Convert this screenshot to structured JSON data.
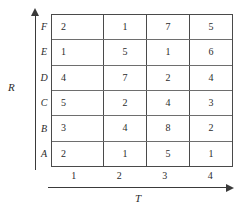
{
  "chart_data": {
    "type": "table",
    "title": "",
    "xlabel": "T",
    "ylabel": "R",
    "grid": true,
    "legend": "none",
    "columns": [
      "1",
      "2",
      "3",
      "4"
    ],
    "rows_top_to_bottom": [
      "F",
      "E",
      "D",
      "C",
      "B",
      "A"
    ],
    "values_top_to_bottom": [
      [
        2,
        1,
        7,
        5
      ],
      [
        1,
        5,
        1,
        6
      ],
      [
        4,
        7,
        2,
        4
      ],
      [
        5,
        2,
        4,
        3
      ],
      [
        3,
        4,
        8,
        2
      ],
      [
        2,
        1,
        5,
        1
      ]
    ],
    "cells": [
      {
        "row": "F",
        "values": [
          "2",
          "1",
          "7",
          "5"
        ]
      },
      {
        "row": "E",
        "values": [
          "1",
          "5",
          "1",
          "6"
        ]
      },
      {
        "row": "D",
        "values": [
          "4",
          "7",
          "2",
          "4"
        ]
      },
      {
        "row": "C",
        "values": [
          "5",
          "2",
          "4",
          "3"
        ]
      },
      {
        "row": "B",
        "values": [
          "3",
          "4",
          "8",
          "2"
        ]
      },
      {
        "row": "A",
        "values": [
          "2",
          "1",
          "5",
          "1"
        ]
      }
    ],
    "axes": {
      "x": {
        "label": "T",
        "ticks": [
          "1",
          "2",
          "3",
          "4"
        ],
        "arrow": "right"
      },
      "y": {
        "label": "R",
        "ticks": [
          "A",
          "B",
          "C",
          "D",
          "E",
          "F"
        ],
        "arrow": "up"
      }
    },
    "colors": {
      "background": "#ffffff",
      "grid_line": "#4a4a4a",
      "axis_line": "#3a3a3a",
      "text": "#2b2b2b"
    }
  }
}
